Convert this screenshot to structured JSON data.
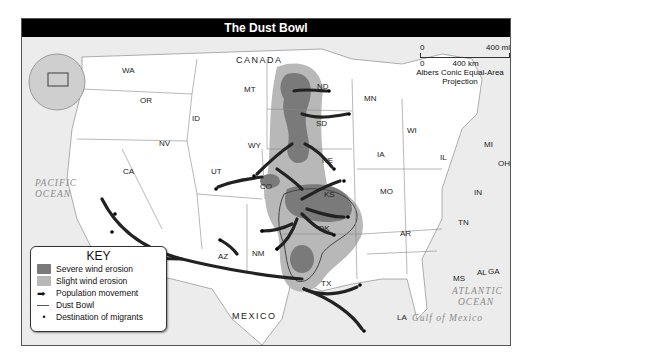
{
  "title": "The Dust Bowl",
  "scale": {
    "mi_start": "0",
    "mi_end": "400 mi",
    "km_start": "0",
    "km_end": "400 km",
    "projection_line1": "Albers Conic Equal-Area",
    "projection_line2": "Projection"
  },
  "key": {
    "title": "KEY",
    "items": [
      {
        "label": "Severe wind erosion",
        "color": "#7a7a7a"
      },
      {
        "label": "Slight wind erosion",
        "color": "#b8b8b8"
      },
      {
        "label": "Population movement",
        "color": "#222222"
      },
      {
        "label": "Dust Bowl",
        "color": "#555555"
      },
      {
        "label": "Destination of migrants",
        "color": "#000000"
      }
    ]
  },
  "regions": {
    "canada": "CANADA",
    "mexico": "MEXICO",
    "pacific_1": "PACIFIC",
    "pacific_2": "OCEAN",
    "atlantic_1": "ATLANTIC",
    "atlantic_2": "OCEAN",
    "gulf": "Gulf of Mexico"
  },
  "states": [
    "WA",
    "OR",
    "CA",
    "NV",
    "ID",
    "MT",
    "WY",
    "UT",
    "CO",
    "AZ",
    "NM",
    "ND",
    "SD",
    "NE",
    "KS",
    "OK",
    "TX",
    "MN",
    "IA",
    "MO",
    "AR",
    "LA",
    "WI",
    "IL",
    "MI",
    "IN",
    "OH",
    "KY",
    "TN",
    "MS",
    "AL",
    "GA",
    "FL",
    "SC",
    "NC",
    "VA",
    "WV",
    "PA",
    "NY",
    "MD",
    "DE",
    "NJ",
    "CT",
    "RI",
    "MA",
    "VT",
    "NH",
    "ME"
  ],
  "cities": [
    "Fargo",
    "Minneapolis",
    "Omaha",
    "Denver",
    "Grand Junction",
    "Kansas City",
    "Tulsa",
    "Oklahoma City",
    "Santa Fe",
    "Albuquerque",
    "Flagstaff",
    "Los Angeles",
    "Bakersfield",
    "Fresno",
    "Dallas",
    "Houston"
  ],
  "compass": {
    "n": "N",
    "e": "E",
    "s": "S",
    "w": "W"
  }
}
